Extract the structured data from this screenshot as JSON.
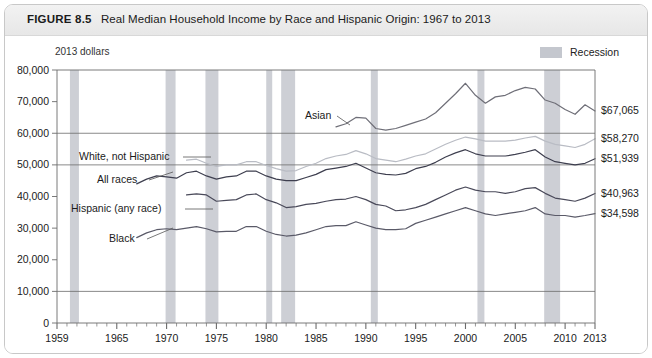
{
  "figure": {
    "number": "FIGURE 8.5",
    "title": "Real Median Household Income by Race and Hispanic Origin: 1967 to 2013"
  },
  "annotations": {
    "units_note": "2013 dollars"
  },
  "legend": {
    "items": [
      {
        "label": "Recession",
        "color": "#c4c7ce",
        "name": "recession"
      }
    ]
  },
  "chart_data": {
    "type": "line",
    "title": "Real Median Household Income by Race and Hispanic Origin: 1967 to 2013",
    "subtitle": "2013 dollars",
    "xlabel": "",
    "ylabel": "",
    "xlim": [
      1959,
      2013
    ],
    "ylim": [
      0,
      80000
    ],
    "grid": true,
    "gridlines_y": [
      10000,
      50000,
      60000
    ],
    "legend_position": "top-right",
    "ytick_labels": [
      "0",
      "10,000",
      "20,000",
      "30,000",
      "40,000",
      "50,000",
      "60,000",
      "70,000",
      "80,000"
    ],
    "yticks": [
      0,
      10000,
      20000,
      30000,
      40000,
      50000,
      60000,
      70000,
      80000
    ],
    "xtick_labels": [
      "1959",
      "1965",
      "1970",
      "1975",
      "1980",
      "1985",
      "1990",
      "1995",
      "2000",
      "2005",
      "2010",
      "2013"
    ],
    "xticks": [
      1959,
      1965,
      1970,
      1975,
      1980,
      1985,
      1990,
      1995,
      2000,
      2005,
      2010,
      2013
    ],
    "recession_bands": [
      {
        "start": 1960.3,
        "end": 1961.2
      },
      {
        "start": 1969.9,
        "end": 1970.9
      },
      {
        "start": 1973.9,
        "end": 1975.2
      },
      {
        "start": 1980.0,
        "end": 1980.6
      },
      {
        "start": 1981.5,
        "end": 1982.9
      },
      {
        "start": 1990.5,
        "end": 1991.2
      },
      {
        "start": 2001.2,
        "end": 2001.9
      },
      {
        "start": 2007.9,
        "end": 2009.5
      }
    ],
    "series": [
      {
        "name": "Asian",
        "color": "#6f6f78",
        "label_text": "Asian",
        "end_value_label": "$67,065",
        "end_value": 67065,
        "x": [
          1987,
          1988,
          1989,
          1990,
          1991,
          1992,
          1993,
          1994,
          1995,
          1996,
          1997,
          1998,
          1999,
          2000,
          2001,
          2002,
          2003,
          2004,
          2005,
          2006,
          2007,
          2008,
          2009,
          2010,
          2011,
          2012,
          2013
        ],
        "values": [
          62000,
          63000,
          65000,
          64800,
          61500,
          61000,
          61500,
          62500,
          63500,
          64500,
          66500,
          69500,
          72500,
          75800,
          72000,
          69500,
          71500,
          72000,
          73500,
          74500,
          74000,
          70500,
          69500,
          67500,
          66000,
          69000,
          67065
        ]
      },
      {
        "name": "White, not Hispanic",
        "color": "#b9bcc4",
        "label_text": "White, not Hispanic",
        "end_value_label": "$58,270",
        "end_value": 58270,
        "x": [
          1972,
          1973,
          1974,
          1975,
          1976,
          1977,
          1978,
          1979,
          1980,
          1981,
          1982,
          1983,
          1984,
          1985,
          1986,
          1987,
          1988,
          1989,
          1990,
          1991,
          1992,
          1993,
          1994,
          1995,
          1996,
          1997,
          1998,
          1999,
          2000,
          2001,
          2002,
          2003,
          2004,
          2005,
          2006,
          2007,
          2008,
          2009,
          2010,
          2011,
          2012,
          2013
        ],
        "values": [
          51500,
          51800,
          50500,
          49500,
          50000,
          50000,
          51000,
          51000,
          49800,
          48800,
          48000,
          48200,
          49500,
          50500,
          52000,
          52800,
          53300,
          54500,
          53500,
          52000,
          51500,
          51000,
          51800,
          52800,
          53500,
          55000,
          56500,
          57800,
          58800,
          58200,
          57500,
          57500,
          57500,
          57800,
          58500,
          59000,
          57500,
          56500,
          56000,
          55500,
          56500,
          58270
        ]
      },
      {
        "name": "All races",
        "color": "#3e3f4f",
        "label_text": "All races",
        "end_value_label": "$51,939",
        "end_value": 51939,
        "x": [
          1967,
          1968,
          1969,
          1970,
          1971,
          1972,
          1973,
          1974,
          1975,
          1976,
          1977,
          1978,
          1979,
          1980,
          1981,
          1982,
          1983,
          1984,
          1985,
          1986,
          1987,
          1988,
          1989,
          1990,
          1991,
          1992,
          1993,
          1994,
          1995,
          1996,
          1997,
          1998,
          1999,
          2000,
          2001,
          2002,
          2003,
          2004,
          2005,
          2006,
          2007,
          2008,
          2009,
          2010,
          2011,
          2012,
          2013
        ],
        "values": [
          44000,
          45500,
          46500,
          46200,
          45800,
          47500,
          48000,
          46500,
          45500,
          46200,
          46500,
          48000,
          48000,
          46500,
          45500,
          45000,
          45000,
          46000,
          47000,
          48500,
          49000,
          49500,
          50500,
          49000,
          47500,
          47000,
          46800,
          47300,
          48800,
          49500,
          50800,
          52500,
          53800,
          54800,
          53500,
          52800,
          52800,
          52800,
          53300,
          54000,
          54800,
          52500,
          51000,
          50500,
          50000,
          50500,
          51939
        ]
      },
      {
        "name": "Hispanic (any race)",
        "color": "#4a4a5a",
        "label_text": "Hispanic (any race)",
        "end_value_label": "$40,963",
        "end_value": 40963,
        "x": [
          1972,
          1973,
          1974,
          1975,
          1976,
          1977,
          1978,
          1979,
          1980,
          1981,
          1982,
          1983,
          1984,
          1985,
          1986,
          1987,
          1988,
          1989,
          1990,
          1991,
          1992,
          1993,
          1994,
          1995,
          1996,
          1997,
          1998,
          1999,
          2000,
          2001,
          2002,
          2003,
          2004,
          2005,
          2006,
          2007,
          2008,
          2009,
          2010,
          2011,
          2012,
          2013
        ],
        "values": [
          40500,
          40800,
          40500,
          38500,
          38800,
          39000,
          40500,
          40800,
          39000,
          38000,
          36500,
          36800,
          37500,
          37800,
          38500,
          39000,
          39200,
          40000,
          39000,
          37500,
          37000,
          35500,
          35800,
          36500,
          37500,
          39000,
          40500,
          42000,
          43000,
          42000,
          41500,
          41500,
          41000,
          41500,
          42500,
          42800,
          41000,
          39500,
          39000,
          38500,
          39500,
          40963
        ]
      },
      {
        "name": "Black",
        "color": "#5a5a68",
        "label_text": "Black",
        "end_value_label": "$34,598",
        "end_value": 34598,
        "x": [
          1967,
          1968,
          1969,
          1970,
          1971,
          1972,
          1973,
          1974,
          1975,
          1976,
          1977,
          1978,
          1979,
          1980,
          1981,
          1982,
          1983,
          1984,
          1985,
          1986,
          1987,
          1988,
          1989,
          1990,
          1991,
          1992,
          1993,
          1994,
          1995,
          1996,
          1997,
          1998,
          1999,
          2000,
          2001,
          2002,
          2003,
          2004,
          2005,
          2006,
          2007,
          2008,
          2009,
          2010,
          2011,
          2012,
          2013
        ],
        "values": [
          27000,
          28500,
          29500,
          29800,
          29500,
          30000,
          30500,
          29800,
          28800,
          29000,
          29000,
          30500,
          30500,
          29000,
          28000,
          27500,
          27800,
          28500,
          29500,
          30500,
          30800,
          30800,
          32000,
          31000,
          30000,
          29500,
          29500,
          29800,
          31500,
          32500,
          33500,
          34500,
          35500,
          36500,
          35500,
          34500,
          34000,
          34500,
          35000,
          35500,
          36500,
          34500,
          34000,
          34000,
          33500,
          34000,
          34598
        ]
      }
    ]
  },
  "series_labels": [
    {
      "text": "Asian",
      "name": "asian"
    },
    {
      "text": "White, not Hispanic",
      "name": "white-not-hispanic"
    },
    {
      "text": "All races",
      "name": "all-races"
    },
    {
      "text": "Hispanic (any race)",
      "name": "hispanic-any-race"
    },
    {
      "text": "Black",
      "name": "black"
    }
  ]
}
